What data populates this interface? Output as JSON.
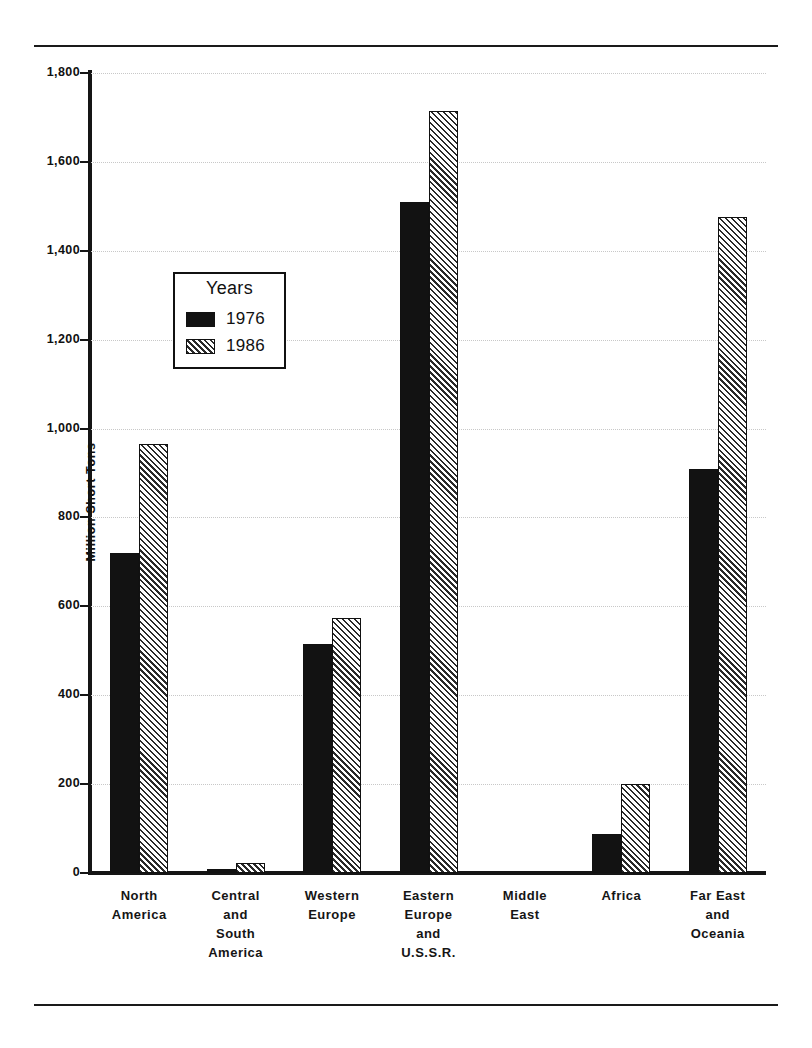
{
  "chart_data": {
    "type": "bar",
    "title": "",
    "xlabel": "",
    "ylabel": "Million Short Tons",
    "ylim": [
      0,
      1800
    ],
    "yticks": [
      0,
      200,
      400,
      600,
      800,
      1000,
      1200,
      1400,
      1600,
      1800
    ],
    "ytick_labels": [
      "0",
      "200",
      "400",
      "600",
      "800",
      "1,000",
      "1,200",
      "1,400",
      "1,600",
      "1,800"
    ],
    "grid": true,
    "legend_position": "upper-left-inside",
    "legend_title": "Years",
    "categories": [
      "North\nAmerica",
      "Central\nand\nSouth\nAmerica",
      "Western\nEurope",
      "Eastern\nEurope\nand\nU.S.S.R.",
      "Middle\nEast",
      "Africa",
      "Far East\nand\nOceania"
    ],
    "series": [
      {
        "name": "1976",
        "fill": "solid-black",
        "color": "#121212",
        "values": [
          720,
          8,
          515,
          1510,
          0,
          88,
          908
        ]
      },
      {
        "name": "1986",
        "fill": "diagonal-hatch",
        "color": "#2a2a2a",
        "values": [
          965,
          22,
          573,
          1715,
          0,
          200,
          1475
        ]
      }
    ]
  },
  "legend": {
    "title": "Years",
    "entries": [
      {
        "label": "1976",
        "swatch": "solid"
      },
      {
        "label": "1986",
        "swatch": "hatch"
      }
    ]
  },
  "axis": {
    "y_title": "Million Short Tons",
    "y_labels": [
      "1,800",
      "1,600",
      "1,400",
      "1,200",
      "1,000",
      "800",
      "600",
      "400",
      "200",
      "0"
    ]
  }
}
